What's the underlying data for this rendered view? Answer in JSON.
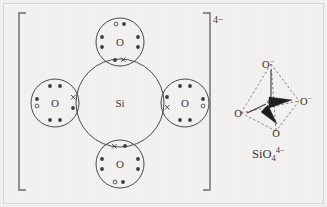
{
  "figure": {
    "name": "silicate-ion-lewis-and-tetrahedral-diagram",
    "background_color": "#f3f2f0",
    "frame_color": "#d8d6d2",
    "ink_color": "#3a3a3a"
  },
  "lewis_structure": {
    "name": "lewis-dot-structure-silicate",
    "bracket": {
      "charge_label": "4−"
    },
    "central_atom": {
      "symbol": "Si",
      "cx": 120,
      "cy": 103,
      "r": 44
    },
    "oxygen_atoms": [
      {
        "id": "oxygen-top",
        "symbol": "O",
        "cx": 120,
        "cy": 42,
        "r": 24
      },
      {
        "id": "oxygen-left",
        "symbol": "O",
        "cx": 55,
        "cy": 103,
        "r": 24
      },
      {
        "id": "oxygen-right",
        "symbol": "O",
        "cx": 185,
        "cy": 103,
        "r": 24
      },
      {
        "id": "oxygen-bottom",
        "symbol": "O",
        "cx": 120,
        "cy": 164,
        "r": 24
      }
    ],
    "electron_legend": {
      "filled_dot": "oxygen-electron",
      "open_circle": "extra-electron",
      "cross": "silicon-electron"
    }
  },
  "tetrahedral_model": {
    "name": "tetrahedral-model-silicate",
    "center_atom": "Si",
    "vertices": [
      {
        "id": "oxygen-top-vertex",
        "label": "O",
        "charge": "−",
        "bond": "line"
      },
      {
        "id": "oxygen-right-vertex",
        "label": "O",
        "charge": "−",
        "bond": "wedge"
      },
      {
        "id": "oxygen-left-vertex",
        "label": "O",
        "charge": "",
        "bond": "line"
      },
      {
        "id": "oxygen-front-vertex",
        "label": "O",
        "charge": "",
        "bond": "wedge"
      }
    ],
    "formula": {
      "element1": "Si",
      "element2": "O",
      "subscript": "4",
      "superscript": "4−"
    }
  }
}
